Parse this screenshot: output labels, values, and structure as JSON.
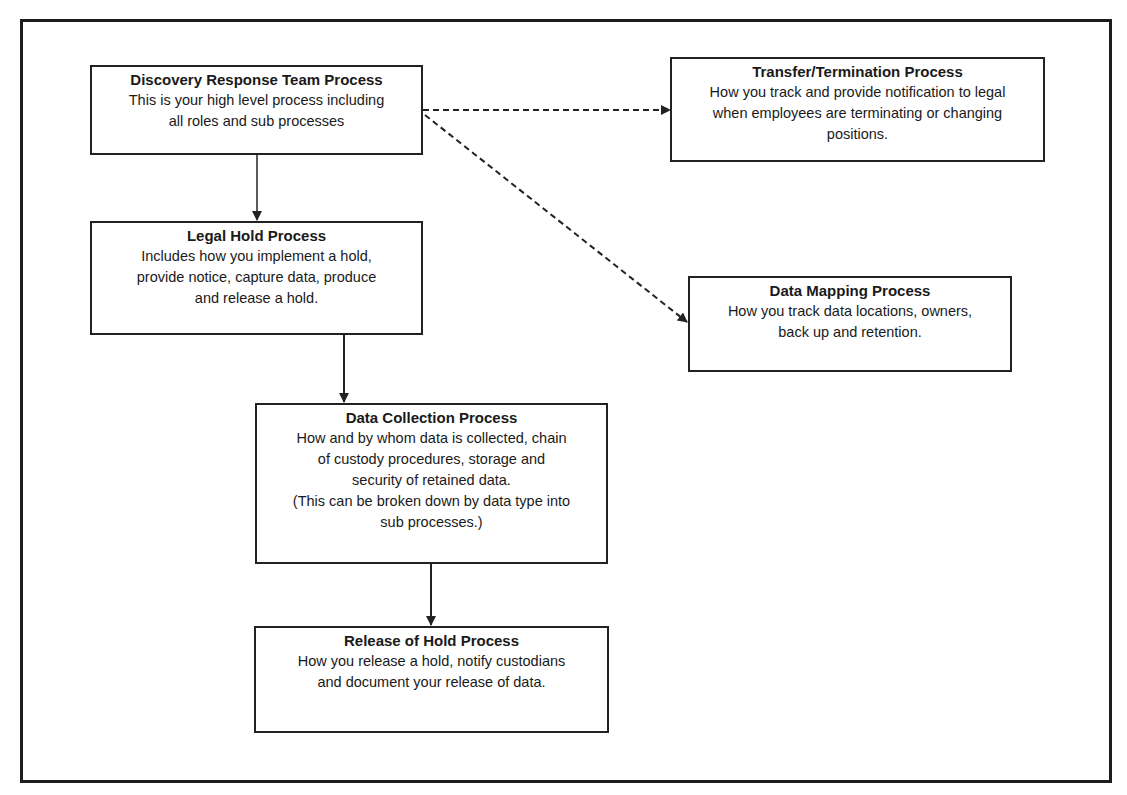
{
  "diagram": {
    "nodes": [
      {
        "id": "discovery",
        "title": "Discovery Response Team Process",
        "lines": [
          "This is your high level process including",
          "all roles and sub processes"
        ]
      },
      {
        "id": "transfer",
        "title": "Transfer/Termination Process",
        "lines": [
          "How you track and provide notification to legal",
          "when employees are terminating or changing",
          "positions."
        ]
      },
      {
        "id": "legal_hold",
        "title": "Legal Hold Process",
        "lines": [
          "Includes how you implement a hold,",
          "provide notice, capture data, produce",
          "and release a hold."
        ]
      },
      {
        "id": "data_mapping",
        "title": "Data Mapping Process",
        "lines": [
          "How you track data locations, owners,",
          "back up and retention."
        ]
      },
      {
        "id": "data_collection",
        "title": "Data Collection Process",
        "lines": [
          "How and by whom data is collected, chain",
          "of custody procedures, storage and",
          "security of retained data.",
          "(This can be broken down by data type into",
          "sub processes.)"
        ]
      },
      {
        "id": "release",
        "title": "Release of Hold Process",
        "lines": [
          "How you release a hold, notify custodians",
          "and document your release of data."
        ]
      }
    ],
    "edges": [
      {
        "from": "discovery",
        "to": "legal_hold",
        "style": "solid"
      },
      {
        "from": "legal_hold",
        "to": "data_collection",
        "style": "solid"
      },
      {
        "from": "data_collection",
        "to": "release",
        "style": "solid"
      },
      {
        "from": "discovery",
        "to": "transfer",
        "style": "dashed"
      },
      {
        "from": "discovery",
        "to": "data_mapping",
        "style": "dashed"
      }
    ],
    "colors": {
      "line": "#222222",
      "background": "#ffffff"
    }
  }
}
